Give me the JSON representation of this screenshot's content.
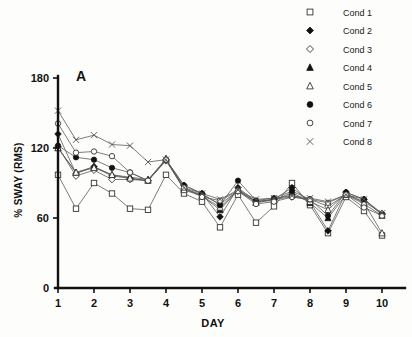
{
  "chart_data": {
    "type": "line",
    "title": "",
    "panel_label": "A",
    "xlabel": "DAY",
    "ylabel": "% SWAY (RMS)",
    "xlim": [
      0.55,
      10.5
    ],
    "ylim": [
      0,
      180
    ],
    "xticks": [
      1,
      2,
      3,
      4,
      5,
      6,
      7,
      8,
      9,
      10
    ],
    "xtick_labels": [
      "1",
      "2",
      "3",
      "4",
      "5",
      "6",
      "7",
      "8",
      "9",
      "10"
    ],
    "yticks": [
      0,
      60,
      120,
      180
    ],
    "ytick_labels": [
      "0",
      "60",
      "120",
      "180"
    ],
    "grid": false,
    "legend_position": "top-right",
    "x": [
      1,
      1.5,
      2,
      2.5,
      3,
      3.5,
      4,
      4.5,
      5,
      5.5,
      6,
      6.5,
      7,
      7.5,
      8,
      8.5,
      9,
      9.5,
      10
    ],
    "series": [
      {
        "name": "Cond 1",
        "marker": "open-square",
        "values": [
          97,
          68,
          90,
          81,
          68,
          67,
          97,
          81,
          74,
          52,
          80,
          56,
          70,
          90,
          71,
          47,
          78,
          66,
          45
        ]
      },
      {
        "name": "Cond 2",
        "marker": "filled-diamond",
        "values": [
          132,
          98,
          104,
          96,
          94,
          92,
          110,
          88,
          81,
          61,
          86,
          74,
          76,
          86,
          74,
          49,
          82,
          76,
          63
        ]
      },
      {
        "name": "Cond 3",
        "marker": "open-diamond",
        "values": [
          121,
          96,
          101,
          93,
          93,
          92,
          109,
          85,
          80,
          72,
          83,
          74,
          76,
          78,
          76,
          70,
          80,
          74,
          64
        ]
      },
      {
        "name": "Cond 4",
        "marker": "filled-triangle",
        "values": [
          120,
          99,
          104,
          97,
          95,
          93,
          110,
          85,
          79,
          67,
          84,
          74,
          75,
          82,
          73,
          60,
          80,
          72,
          62
        ]
      },
      {
        "name": "Cond 5",
        "marker": "open-triangle",
        "values": [
          120,
          99,
          103,
          97,
          94,
          92,
          111,
          84,
          79,
          69,
          84,
          73,
          76,
          80,
          74,
          67,
          81,
          73,
          47
        ]
      },
      {
        "name": "Cond 6",
        "marker": "filled-circle",
        "values": [
          122,
          112,
          110,
          103,
          99,
          92,
          110,
          88,
          81,
          71,
          92,
          75,
          77,
          83,
          76,
          62,
          82,
          76,
          63
        ]
      },
      {
        "name": "Cond 7",
        "marker": "open-circle",
        "values": [
          141,
          116,
          117,
          113,
          99,
          92,
          110,
          86,
          78,
          75,
          83,
          72,
          74,
          78,
          76,
          73,
          80,
          69,
          62
        ]
      },
      {
        "name": "Cond 8",
        "marker": "cross-x",
        "values": [
          152,
          127,
          131,
          123,
          122,
          108,
          110,
          86,
          81,
          76,
          84,
          76,
          77,
          79,
          77,
          74,
          80,
          76,
          64
        ]
      }
    ]
  },
  "legend": {
    "items": [
      {
        "label": "Cond 1",
        "marker": "open-square"
      },
      {
        "label": "Cond 2",
        "marker": "filled-diamond"
      },
      {
        "label": "Cond 3",
        "marker": "open-diamond"
      },
      {
        "label": "Cond 4",
        "marker": "filled-triangle"
      },
      {
        "label": "Cond 5",
        "marker": "open-triangle"
      },
      {
        "label": "Cond 6",
        "marker": "filled-circle"
      },
      {
        "label": "Cond 7",
        "marker": "open-circle"
      },
      {
        "label": "Cond 8",
        "marker": "cross-x"
      }
    ]
  },
  "colors": {
    "axis": "#111111",
    "line": "#5a5a5a",
    "marker_fill": "#111111",
    "marker_open": "#ffffff",
    "background": "#fdfdfb"
  }
}
